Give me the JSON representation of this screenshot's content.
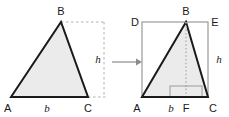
{
  "figure": {
    "colors": {
      "outline": "#1a1a1a",
      "fill": "#ebebeb",
      "rectangle_edge": "#9a9a9a",
      "dashed_guide": "#b0b0b0",
      "dotted_altitude": "#b8b8b8",
      "arrow": "#8c8c8c",
      "label_text": "#1a1a1a"
    },
    "left_figure": {
      "name": "standalone-triangle",
      "vertices": [
        {
          "id": "A",
          "label": "A",
          "x": 11,
          "y": 97
        },
        {
          "id": "B",
          "label": "B",
          "x": 61,
          "y": 22
        },
        {
          "id": "C",
          "label": "C",
          "x": 88,
          "y": 97
        }
      ],
      "labels": {
        "base": "b",
        "height": "h"
      },
      "guides": {
        "top_dashed_from_x": 61,
        "top_dashed_to_x": 106,
        "top_dashed_y": 22,
        "bottom_dashed_from_x": 88,
        "bottom_dashed_to_x": 106,
        "bottom_dashed_y": 97,
        "height_line_x": 104,
        "height_line_top_y": 22,
        "height_line_bottom_y": 97
      }
    },
    "arrow": {
      "name": "transformation-arrow",
      "from_x": 112,
      "to_x": 139,
      "y": 62
    },
    "right_figure": {
      "name": "triangle-in-rectangle",
      "rectangle": {
        "left": 142,
        "top": 22,
        "right": 208,
        "bottom": 97
      },
      "vertices": [
        {
          "id": "D",
          "label": "D",
          "x": 142,
          "y": 22
        },
        {
          "id": "B",
          "label": "B",
          "x": 186,
          "y": 22
        },
        {
          "id": "E",
          "label": "E",
          "x": 208,
          "y": 22
        },
        {
          "id": "A",
          "label": "A",
          "x": 142,
          "y": 97
        },
        {
          "id": "F",
          "label": "F",
          "x": 186,
          "y": 97
        },
        {
          "id": "C",
          "label": "C",
          "x": 208,
          "y": 97
        }
      ],
      "labels": {
        "base": "b",
        "height": "h"
      },
      "altitude": {
        "x": 186,
        "top_y": 22,
        "bottom_y": 97
      },
      "right_angle_marker": {
        "x": 170,
        "y": 86,
        "width": 32,
        "height": 11
      }
    }
  }
}
